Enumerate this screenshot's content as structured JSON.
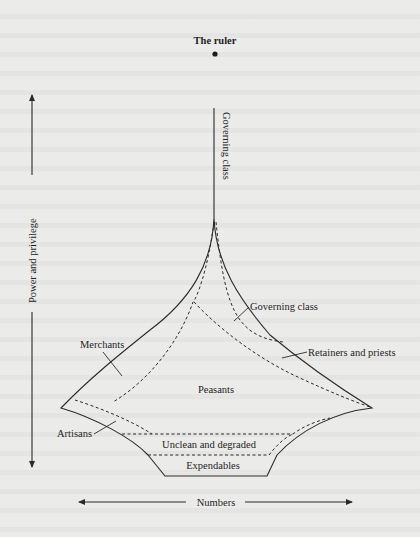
{
  "figure": {
    "title_node": "The ruler",
    "vertical_axis": {
      "label": "Power and privilege",
      "direction": "bidirectional-vertical"
    },
    "horizontal_axis": {
      "label": "Numbers",
      "direction": "bidirectional-horizontal"
    },
    "labels": {
      "ruler": "The ruler",
      "governing_class_vertical": "Governing class",
      "governing_class": "Governing class",
      "merchants": "Merchants",
      "retainers": "Retainers and priests",
      "peasants": "Peasants",
      "artisans": "Artisans",
      "unclean": "Unclean and degraded",
      "expendables": "Expendables"
    },
    "strata_top_to_bottom": [
      "The ruler",
      "Governing class",
      "Retainers and priests",
      "Merchants",
      "Peasants",
      "Artisans",
      "Unclean and degraded",
      "Expendables"
    ],
    "colors": {
      "background": "#ebebe9",
      "ink": "#2a2a2a"
    }
  }
}
